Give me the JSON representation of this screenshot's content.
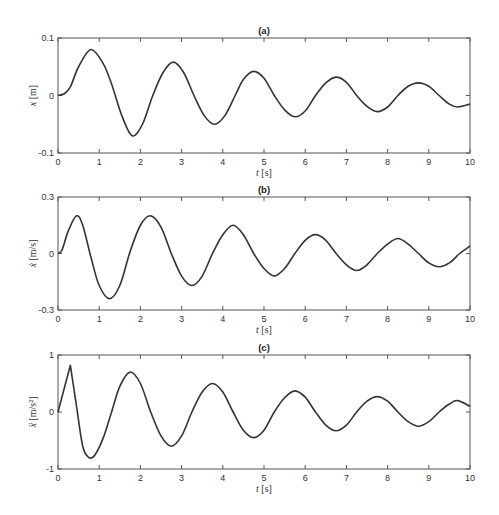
{
  "chart_data": [
    {
      "type": "line",
      "title": "(a)",
      "xlabel": "t [s]",
      "ylabel": "x [m]",
      "xlim": [
        0,
        10
      ],
      "ylim": [
        -0.1,
        0.1
      ],
      "xticks": [
        "0",
        "1",
        "2",
        "3",
        "4",
        "5",
        "6",
        "7",
        "8",
        "9",
        "10"
      ],
      "yticks": [
        "-0.1",
        "0",
        "0.1"
      ],
      "grid": false,
      "series": [
        {
          "name": "x",
          "x": [
            0,
            0.15,
            0.3,
            0.5,
            0.8,
            1.1,
            1.3,
            1.55,
            1.8,
            2.05,
            2.3,
            2.55,
            2.8,
            3.05,
            3.3,
            3.55,
            3.8,
            4.05,
            4.3,
            4.5,
            4.75,
            5.0,
            5.25,
            5.5,
            5.75,
            6.0,
            6.25,
            6.5,
            6.75,
            7.0,
            7.25,
            7.5,
            7.75,
            8.0,
            8.25,
            8.5,
            8.75,
            9.0,
            9.25,
            9.5,
            9.7,
            10
          ],
          "values": [
            0,
            0.003,
            0.015,
            0.05,
            0.08,
            0.055,
            0.02,
            -0.035,
            -0.07,
            -0.05,
            0.0,
            0.04,
            0.058,
            0.04,
            0.0,
            -0.035,
            -0.05,
            -0.035,
            0.0,
            0.028,
            0.042,
            0.03,
            0.0,
            -0.025,
            -0.037,
            -0.027,
            0.0,
            0.022,
            0.032,
            0.023,
            0.0,
            -0.019,
            -0.028,
            -0.02,
            0.0,
            0.016,
            0.022,
            0.016,
            0.0,
            -0.015,
            -0.02,
            -0.015
          ]
        }
      ]
    },
    {
      "type": "line",
      "title": "(b)",
      "xlabel": "t [s]",
      "ylabel": "ẋ [m/s]",
      "xlim": [
        0,
        10
      ],
      "ylim": [
        -0.3,
        0.3
      ],
      "xticks": [
        "0",
        "1",
        "2",
        "3",
        "4",
        "5",
        "6",
        "7",
        "8",
        "9",
        "10"
      ],
      "yticks": [
        "-0.3",
        "0",
        "0.3"
      ],
      "grid": false,
      "series": [
        {
          "name": "xdot",
          "x": [
            0,
            0.1,
            0.25,
            0.45,
            0.6,
            0.8,
            1.0,
            1.25,
            1.5,
            1.75,
            2.0,
            2.25,
            2.5,
            2.75,
            3.0,
            3.25,
            3.5,
            3.75,
            4.0,
            4.25,
            4.5,
            4.75,
            5.0,
            5.25,
            5.5,
            5.75,
            6.0,
            6.25,
            6.5,
            6.75,
            7.0,
            7.25,
            7.5,
            7.75,
            8.0,
            8.25,
            8.5,
            8.75,
            9.0,
            9.25,
            9.5,
            9.75,
            10
          ],
          "values": [
            0,
            0.02,
            0.12,
            0.2,
            0.15,
            -0.02,
            -0.17,
            -0.24,
            -0.17,
            0.01,
            0.15,
            0.2,
            0.14,
            0.0,
            -0.12,
            -0.17,
            -0.12,
            0.0,
            0.1,
            0.15,
            0.1,
            0.0,
            -0.08,
            -0.12,
            -0.08,
            0.0,
            0.07,
            0.1,
            0.07,
            0.0,
            -0.06,
            -0.09,
            -0.06,
            0.0,
            0.05,
            0.08,
            0.05,
            0.0,
            -0.05,
            -0.07,
            -0.05,
            0.0,
            0.04
          ]
        }
      ]
    },
    {
      "type": "line",
      "title": "(c)",
      "xlabel": "t [s]",
      "ylabel": "ẍ [m/s²]",
      "xlim": [
        0,
        10
      ],
      "ylim": [
        -1,
        1
      ],
      "xticks": [
        "0",
        "1",
        "2",
        "3",
        "4",
        "5",
        "6",
        "7",
        "8",
        "9",
        "10"
      ],
      "yticks": [
        "-1",
        "0",
        "1"
      ],
      "grid": false,
      "series": [
        {
          "name": "xddot",
          "x": [
            0,
            0.3,
            0.45,
            0.6,
            0.75,
            0.9,
            1.1,
            1.3,
            1.5,
            1.75,
            2.0,
            2.25,
            2.5,
            2.75,
            3.0,
            3.25,
            3.5,
            3.75,
            4.0,
            4.25,
            4.5,
            4.75,
            5.0,
            5.25,
            5.5,
            5.75,
            6.0,
            6.25,
            6.5,
            6.75,
            7.0,
            7.25,
            7.5,
            7.75,
            8.0,
            8.25,
            8.5,
            8.75,
            9.0,
            9.25,
            9.5,
            9.7,
            10
          ],
          "values": [
            0,
            0.82,
            0.1,
            -0.6,
            -0.8,
            -0.75,
            -0.45,
            0.0,
            0.45,
            0.7,
            0.5,
            0.0,
            -0.42,
            -0.6,
            -0.42,
            0.0,
            0.35,
            0.5,
            0.35,
            0.0,
            -0.32,
            -0.45,
            -0.32,
            0.0,
            0.25,
            0.37,
            0.26,
            0.0,
            -0.23,
            -0.33,
            -0.23,
            0.0,
            0.19,
            0.27,
            0.19,
            0.0,
            -0.17,
            -0.25,
            -0.17,
            0.0,
            0.14,
            0.2,
            0.1
          ]
        }
      ]
    }
  ],
  "panels": [
    {
      "title": "(a)",
      "ylabel_var": "x",
      "ylabel_unit": "[m]",
      "xlabel_var": "t",
      "xlabel_unit": "[s]"
    },
    {
      "title": "(b)",
      "ylabel_var": "ẋ",
      "ylabel_unit": "[m/s]",
      "xlabel_var": "t",
      "xlabel_unit": "[s]"
    },
    {
      "title": "(c)",
      "ylabel_var": "ẍ",
      "ylabel_unit": "[m/s²]",
      "xlabel_var": "t",
      "xlabel_unit": "[s]"
    }
  ],
  "colors": {
    "line": "#333333",
    "axis": "#555555",
    "background": "#ffffff"
  }
}
